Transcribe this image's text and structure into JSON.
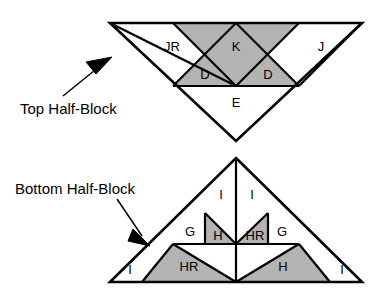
{
  "figure": {
    "background_color": "#ffffff",
    "line_color": "#000000",
    "shaded_fill": "#b3b3b3",
    "plain_fill": "#ffffff"
  },
  "callouts": {
    "top": {
      "text": "Top Half-Block",
      "x": 20,
      "y": 110
    },
    "bottom": {
      "text": "Bottom Half-Block",
      "x": 15,
      "y": 190
    }
  },
  "top_half_block": {
    "name": "Top Half-Block",
    "orientation": "apex-down",
    "outline": "110,23 362,23 236,141",
    "pieces": [
      {
        "id": "JR",
        "label": "JR",
        "shaded": false,
        "points": "110,23 236,23 173,86",
        "label_x": 172,
        "label_y": 48
      },
      {
        "id": "K",
        "label": "K",
        "shaded": true,
        "points": "173,23 299,23 236,86",
        "label_x": 236,
        "label_y": 48
      },
      {
        "id": "J",
        "label": "J",
        "shaded": false,
        "points": "299,23 362,23 299,86",
        "label_x": 321,
        "label_y": 48
      },
      {
        "id": "D-left",
        "label": "D",
        "shaded": true,
        "points": "173,86 205,55 236,86",
        "label_x": 205,
        "label_y": 76
      },
      {
        "id": "D-right",
        "label": "D",
        "shaded": true,
        "points": "236,86 268,55 299,86",
        "label_x": 268,
        "label_y": 76
      },
      {
        "id": "E",
        "label": "E",
        "shaded": false,
        "points": "173,86 299,86 236,141",
        "label_x": 236,
        "label_y": 104
      }
    ],
    "inner_edges": [
      "173,86 299,86",
      "110,23 236,86",
      "173,23 236,86",
      "299,23 236,86",
      "362,23 299,86",
      "173,86 236,23",
      "299,86 236,23"
    ]
  },
  "bottom_half_block": {
    "name": "Bottom Half-Block",
    "orientation": "apex-up",
    "outline": "236,158 362,282 110,282",
    "pieces": [
      {
        "id": "I-top-left",
        "label": "I",
        "shaded": false,
        "points": "236,158 236,244 205,213",
        "label_x": 221,
        "label_y": 196
      },
      {
        "id": "I-top-right",
        "label": "I",
        "shaded": false,
        "points": "236,158 268,213 236,244",
        "label_x": 252,
        "label_y": 196
      },
      {
        "id": "G-left",
        "label": "G",
        "shaded": false,
        "points": "173,244 205,213 205,244",
        "label_x": 190,
        "label_y": 233
      },
      {
        "id": "G-right",
        "label": "G",
        "shaded": false,
        "points": "268,213 299,244 268,244",
        "label_x": 282,
        "label_y": 233
      },
      {
        "id": "H-upper",
        "label": "H",
        "shaded": true,
        "points": "205,213 236,244 205,244",
        "label_x": 218,
        "label_y": 237
      },
      {
        "id": "HR-upper",
        "label": "HR",
        "shaded": true,
        "points": "268,213 268,244 236,244",
        "label_x": 255,
        "label_y": 237
      },
      {
        "id": "HR-lower",
        "label": "HR",
        "shaded": true,
        "points": "142,282 236,282 173,244",
        "label_x": 189,
        "label_y": 268
      },
      {
        "id": "H-lower",
        "label": "H",
        "shaded": true,
        "points": "236,282 330,282 299,244",
        "label_x": 283,
        "label_y": 268
      },
      {
        "id": "I-bottom-left",
        "label": "I",
        "shaded": false,
        "points": "110,282 142,282 142,250",
        "label_x": 130,
        "label_y": 271
      },
      {
        "id": "I-bottom-right",
        "label": "I",
        "shaded": false,
        "points": "330,282 362,282 330,250",
        "label_x": 342,
        "label_y": 271
      }
    ],
    "inner_edges": [
      "173,244 299,244",
      "236,158 236,282",
      "205,213 205,244",
      "268,213 268,244",
      "236,244 205,213",
      "236,244 268,213",
      "173,244 236,282",
      "299,244 236,282",
      "142,282 173,244",
      "330,282 299,244"
    ]
  }
}
